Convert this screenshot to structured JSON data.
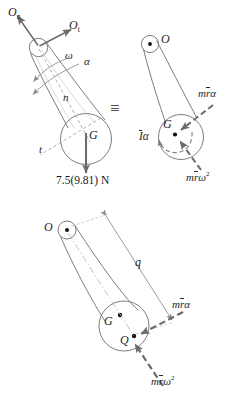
{
  "figure": {
    "equivalence_symbol": "≡"
  },
  "diagram_fbd": {
    "name": "free-body-diagram",
    "reaction_normal": {
      "base": "O",
      "sub": "n"
    },
    "reaction_tangential": {
      "base": "O",
      "sub": "t"
    },
    "angular_velocity": "ω",
    "angular_acceleration": "α",
    "axis_normal": "n",
    "axis_tangential": "t",
    "center_of_mass": "G",
    "weight_label": "7.5(9.81) N"
  },
  "diagram_kinetic": {
    "name": "kinetic-diagram",
    "pivot": "O",
    "center_of_mass": "G",
    "couple": {
      "inertia": "I",
      "alpha": "α",
      "text": "Iα"
    },
    "tangential_force": {
      "m": "m",
      "r": "r",
      "alpha": "α",
      "text": "mrα"
    },
    "normal_force": {
      "m": "m",
      "r": "r",
      "omega": "ω",
      "exponent": "2",
      "text": "mrω²"
    }
  },
  "diagram_resultant": {
    "name": "resultant-force-diagram",
    "pivot": "O",
    "center_of_mass": "G",
    "resultant_point": "Q",
    "distance": "q",
    "tangential_force": {
      "m": "m",
      "r": "r",
      "alpha": "α",
      "text": "mrα"
    },
    "normal_force": {
      "m": "m",
      "r": "r",
      "omega": "ω",
      "exponent": "2",
      "text": "mrω²"
    }
  },
  "colors": {
    "outline": "#6e6e6e",
    "arrow": "#6b6b6b",
    "dashed": "#7a7a7a",
    "text": "#262626",
    "point": "#111111",
    "background": "#ffffff"
  }
}
